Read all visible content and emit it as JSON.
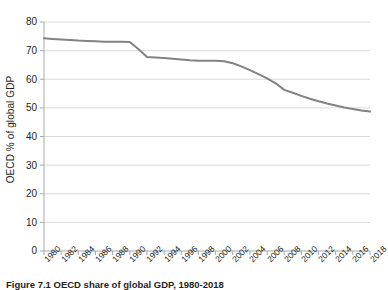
{
  "figure": {
    "caption": "Figure 7.1  OECD share of global GDP, 1980-2018",
    "background_color": "#ffffff"
  },
  "chart_data": {
    "type": "line",
    "title": "",
    "xlabel": "",
    "ylabel": "OECD % of global GDP",
    "xlim": [
      1980,
      2018
    ],
    "ylim": [
      0,
      80
    ],
    "ytick_step": 10,
    "xtick_step": 2,
    "grid": "horizontal",
    "legend": "none",
    "line_color": "#808285",
    "line_width": 2,
    "axis_color": "#a7a9ac",
    "grid_color": "#d9dadb",
    "ytick_labels": [
      "0",
      "10",
      "20",
      "30",
      "40",
      "50",
      "60",
      "70",
      "80"
    ],
    "ytick_values": [
      0,
      10,
      20,
      30,
      40,
      50,
      60,
      70,
      80
    ],
    "xtick_labels": [
      "1980",
      "1982",
      "1984",
      "1986",
      "1988",
      "1990",
      "1992",
      "1994",
      "1996",
      "1998",
      "2000",
      "2002",
      "2004",
      "2006",
      "2008",
      "2010",
      "2012",
      "2014",
      "2016",
      "2018"
    ],
    "xtick_values": [
      1980,
      1982,
      1984,
      1986,
      1988,
      1990,
      1992,
      1994,
      1996,
      1998,
      2000,
      2002,
      2004,
      2006,
      2008,
      2010,
      2012,
      2014,
      2016,
      2018
    ],
    "x": [
      1980,
      1981,
      1982,
      1983,
      1984,
      1985,
      1986,
      1987,
      1988,
      1989,
      1990,
      1991,
      1992,
      1993,
      1994,
      1995,
      1996,
      1997,
      1998,
      1999,
      2000,
      2001,
      2002,
      2003,
      2004,
      2005,
      2006,
      2007,
      2008,
      2009,
      2010,
      2011,
      2012,
      2013,
      2014,
      2015,
      2016,
      2017,
      2018
    ],
    "series": [
      {
        "name": "OECD % of global GDP",
        "values": [
          74.3,
          74.1,
          73.9,
          73.7,
          73.5,
          73.4,
          73.3,
          73.1,
          73.1,
          73.1,
          73.0,
          70.6,
          67.8,
          67.6,
          67.4,
          67.2,
          66.9,
          66.6,
          66.5,
          66.5,
          66.5,
          66.3,
          65.6,
          64.5,
          63.2,
          61.8,
          60.3,
          58.6,
          56.3,
          55.3,
          54.2,
          53.2,
          52.3,
          51.5,
          50.8,
          50.1,
          49.6,
          49.1,
          48.7
        ]
      }
    ]
  }
}
